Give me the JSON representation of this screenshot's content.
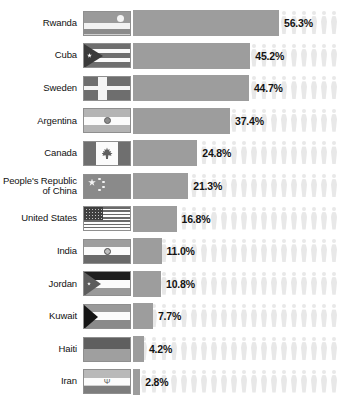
{
  "chart_data": {
    "type": "bar",
    "title": "",
    "subtitle": "",
    "xlabel": "",
    "ylabel": "",
    "categories": [
      "Rwanda",
      "Cuba",
      "Sweden",
      "Argentina",
      "Canada",
      "People's Republic of China",
      "United States",
      "India",
      "Jordan",
      "Kuwait",
      "Haiti",
      "Iran"
    ],
    "values": [
      56.3,
      45.2,
      44.7,
      37.4,
      24.8,
      21.3,
      16.8,
      11.0,
      10.8,
      7.7,
      4.2,
      2.8
    ],
    "value_labels": [
      "56.3%",
      "45.2%",
      "44.7%",
      "37.4%",
      "24.8%",
      "21.3%",
      "16.8%",
      "11.0%",
      "10.8%",
      "7.7%",
      "4.2%",
      "2.8%"
    ],
    "xlim": [
      0,
      56.3
    ],
    "grid": false,
    "legend": null,
    "orientation": "horizontal",
    "colors": {
      "bar": "#9d9d9d",
      "pictogram": "#e8e8e8",
      "text": "#141414",
      "background": "#ffffff"
    }
  },
  "rows": [
    {
      "country": "Rwanda",
      "value_label": "56.3%",
      "value": 56.3,
      "flag": "flag-rwanda"
    },
    {
      "country": "Cuba",
      "value_label": "45.2%",
      "value": 45.2,
      "flag": "flag-cuba"
    },
    {
      "country": "Sweden",
      "value_label": "44.7%",
      "value": 44.7,
      "flag": "flag-sweden"
    },
    {
      "country": "Argentina",
      "value_label": "37.4%",
      "value": 37.4,
      "flag": "flag-argentina"
    },
    {
      "country": "Canada",
      "value_label": "24.8%",
      "value": 24.8,
      "flag": "flag-canada"
    },
    {
      "country": "People's Republic of China",
      "value_label": "21.3%",
      "value": 21.3,
      "flag": "flag-china"
    },
    {
      "country": "United States",
      "value_label": "16.8%",
      "value": 16.8,
      "flag": "flag-united-states"
    },
    {
      "country": "India",
      "value_label": "11.0%",
      "value": 11.0,
      "flag": "flag-india"
    },
    {
      "country": "Jordan",
      "value_label": "10.8%",
      "value": 10.8,
      "flag": "flag-jordan"
    },
    {
      "country": "Kuwait",
      "value_label": "7.7%",
      "value": 7.7,
      "flag": "flag-kuwait"
    },
    {
      "country": "Haiti",
      "value_label": "4.2%",
      "value": 4.2,
      "flag": "flag-haiti"
    },
    {
      "country": "Iran",
      "value_label": "2.8%",
      "value": 2.8,
      "flag": "flag-iran"
    }
  ]
}
